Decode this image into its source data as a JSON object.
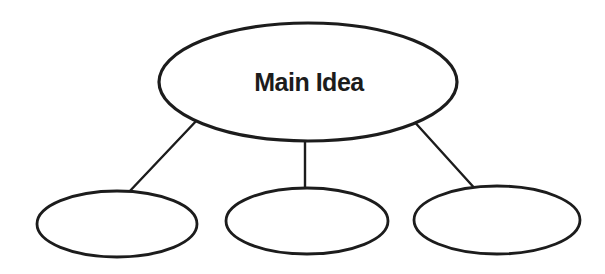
{
  "colors": {
    "background": "#ffffff",
    "stroke": "#1c1c1c",
    "node_fill": "#ffffff",
    "text": "#1c1c1c"
  },
  "diagram": {
    "kind": "main-idea-graphic-organizer",
    "main_node": {
      "label": "Main Idea"
    },
    "child_nodes": [
      {
        "label": ""
      },
      {
        "label": ""
      },
      {
        "label": ""
      }
    ],
    "connector_count": 3
  }
}
